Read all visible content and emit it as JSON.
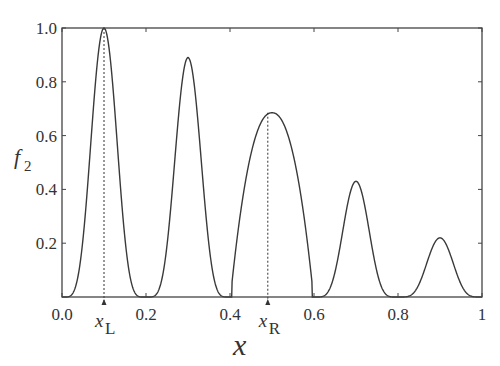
{
  "chart_data": {
    "type": "line",
    "title": "",
    "xlabel": "x",
    "ylabel": "f_2",
    "ylabel_main": "f",
    "ylabel_sub": "2",
    "xlim": [
      0,
      1
    ],
    "ylim": [
      0,
      1
    ],
    "grid": false,
    "legend": null,
    "x_ticks": [
      "0.0",
      "0.2",
      "0.4",
      "0.6",
      "0.8",
      "1"
    ],
    "x_tick_values": [
      0,
      0.2,
      0.4,
      0.6,
      0.8,
      1.0
    ],
    "y_ticks": [
      "0.2",
      "0.4",
      "0.6",
      "0.8",
      "1.0"
    ],
    "y_tick_values": [
      0.2,
      0.4,
      0.6,
      0.8,
      1.0
    ],
    "series": [
      {
        "name": "f2",
        "style": "solid",
        "peaks": [
          {
            "x": 0.1,
            "y": 1.0
          },
          {
            "x": 0.3,
            "y": 0.89
          },
          {
            "x": 0.5,
            "y": 0.685
          },
          {
            "x": 0.7,
            "y": 0.43
          },
          {
            "x": 0.9,
            "y": 0.22
          }
        ]
      }
    ],
    "annotations": [
      {
        "label_main": "x",
        "label_sub": "L",
        "x": 0.1,
        "y_top": 1.0,
        "style": "dotted vertical line with arrow"
      },
      {
        "label_main": "x",
        "label_sub": "R",
        "x": 0.49,
        "y_top": 0.685,
        "style": "dotted vertical line with arrow"
      }
    ]
  }
}
